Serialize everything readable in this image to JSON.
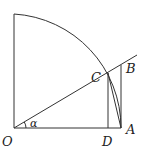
{
  "diagram": {
    "type": "unit-circle-quadrant",
    "labels": {
      "O": "O",
      "A": "A",
      "B": "B",
      "C": "C",
      "D": "D",
      "alpha": "α"
    },
    "points": {
      "O": [
        14,
        128
      ],
      "A": [
        121,
        128
      ],
      "B": [
        121,
        65
      ],
      "C": [
        108,
        73
      ],
      "D": [
        108,
        128
      ],
      "arc_top": [
        14,
        14
      ],
      "ray_end": [
        137,
        55
      ]
    },
    "colors": {
      "stroke": "#333333",
      "text": "#222222",
      "background": "#ffffff"
    }
  }
}
